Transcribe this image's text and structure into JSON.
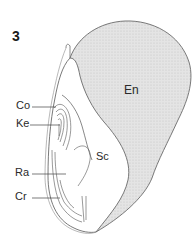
{
  "figure": {
    "number": "3",
    "colors": {
      "endosperm_fill": "#e2e2e2",
      "outline": "#6a6a6a",
      "line": "#555555",
      "text": "#2a2a2a"
    },
    "labels": {
      "en": "En",
      "sc": "Sc",
      "co": "Co",
      "ke": "Ke",
      "ra": "Ra",
      "cr": "Cr"
    }
  }
}
